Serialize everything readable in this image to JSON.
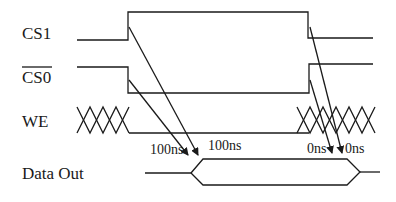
{
  "diagram": {
    "type": "timing-diagram",
    "signals": [
      {
        "id": "cs1",
        "label": "CS1",
        "overline": false
      },
      {
        "id": "cs0",
        "label": "CS0",
        "overline": true
      },
      {
        "id": "we",
        "label": "WE",
        "overline": false
      },
      {
        "id": "dout",
        "label": "Data Out",
        "overline": false
      }
    ],
    "annotations": {
      "left_1": "100ns",
      "left_2": "100ns",
      "right_1": "0ns",
      "right_2": "0ns"
    }
  }
}
